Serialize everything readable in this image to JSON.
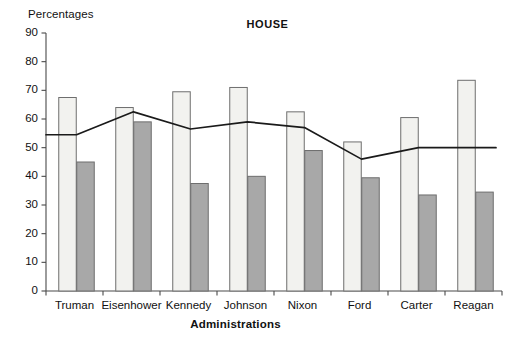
{
  "chart_data": {
    "type": "bar",
    "title": "HOUSE",
    "xlabel": "Administrations",
    "ylabel": "Percentages",
    "categories": [
      "Truman",
      "Eisenhower",
      "Kennedy",
      "Johnson",
      "Nixon",
      "Ford",
      "Carter",
      "Reagan"
    ],
    "ylim": [
      0,
      90
    ],
    "yticks": [
      0,
      10,
      20,
      30,
      40,
      50,
      60,
      70,
      80,
      90
    ],
    "ytick_labels": [
      "0",
      "10",
      "20",
      "30",
      "40",
      "50",
      "60",
      "70",
      "80",
      "90"
    ],
    "grid": false,
    "legend": "none",
    "series": [
      {
        "name": "light-bar",
        "type": "bar",
        "color": "#f2f2ef",
        "edge_color": "#6e6e6e",
        "values": [
          67.5,
          64.0,
          69.5,
          71.0,
          62.5,
          52.0,
          60.5,
          73.5
        ]
      },
      {
        "name": "dark-bar",
        "type": "bar",
        "color": "#a8a8a8",
        "edge_color": "#6e6e6e",
        "values": [
          45.0,
          59.0,
          37.5,
          40.0,
          49.0,
          39.5,
          33.5,
          34.5
        ]
      },
      {
        "name": "trend-line",
        "type": "line",
        "color": "#1a1a1a",
        "values": [
          54.5,
          62.5,
          56.5,
          59.0,
          57.0,
          46.0,
          50.0,
          50.0
        ]
      }
    ]
  },
  "axes": {
    "y_axis_name": "percentage-axis",
    "x_axis_name": "administration-axis"
  }
}
